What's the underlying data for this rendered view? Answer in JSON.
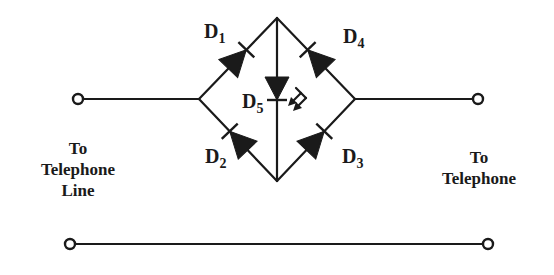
{
  "diagram": {
    "type": "circuit-schematic",
    "line_color": "#1a1a1a",
    "background": "#ffffff",
    "diodes": [
      {
        "id": "D1",
        "letter": "D",
        "sub": "1",
        "from": "left-node",
        "to": "top-node"
      },
      {
        "id": "D2",
        "letter": "D",
        "sub": "2",
        "from": "bottom-node",
        "to": "left-node"
      },
      {
        "id": "D3",
        "letter": "D",
        "sub": "3",
        "from": "bottom-node",
        "to": "right-node"
      },
      {
        "id": "D4",
        "letter": "D",
        "sub": "4",
        "from": "right-node",
        "to": "top-node"
      },
      {
        "id": "D5",
        "letter": "D",
        "sub": "5",
        "from": "top-node",
        "to": "bottom-node",
        "kind": "LED"
      }
    ],
    "labels": {
      "left": [
        "To",
        "Telephone",
        "Line"
      ],
      "right": [
        "To",
        "Telephone"
      ]
    }
  }
}
